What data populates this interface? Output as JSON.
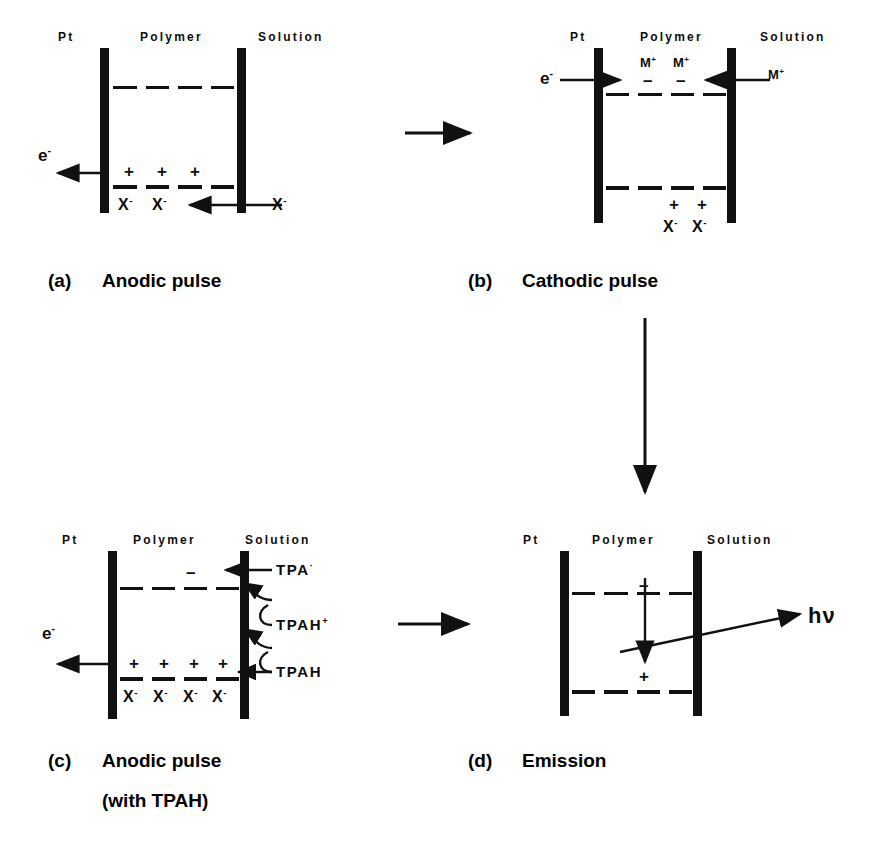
{
  "figure": {
    "type": "mechanism-diagram",
    "region_labels": {
      "electrode": "Pt",
      "film": "Polymer",
      "bulk": "Solution"
    }
  },
  "panels": [
    {
      "id": "a",
      "caption_tag": "(a)",
      "caption": "Anodic pulse",
      "headers": {
        "left": "Pt",
        "middle": "Polymer",
        "right": "Solution"
      },
      "electron_label": "e",
      "electron_charge": "-",
      "polarity": "anodic",
      "holes": [
        "+",
        "+",
        "+"
      ],
      "counter_ion_labels": [
        "X",
        "X"
      ],
      "counter_ion_charge": "-",
      "incoming_ion_label": "X",
      "incoming_ion_charge": "-",
      "levels": [
        "LUMO",
        "HOMO"
      ]
    },
    {
      "id": "b",
      "caption_tag": "(b)",
      "caption": "Cathodic pulse",
      "headers": {
        "left": "Pt",
        "middle": "Polymer",
        "right": "Solution"
      },
      "electron_label": "e",
      "electron_charge": "-",
      "polarity": "cathodic",
      "injected_electrons": [
        "–",
        "–"
      ],
      "cation_labels": [
        "M",
        "M"
      ],
      "cation_charge": "+",
      "incoming_ion_label": "M",
      "incoming_ion_charge": "+",
      "residual_holes": [
        "+",
        "+"
      ],
      "residual_ion_labels": [
        "X",
        "X"
      ],
      "residual_ion_charge": "-"
    },
    {
      "id": "c",
      "caption_tag": "(c)",
      "caption": "Anodic pulse",
      "caption_line2": "(with TPAH)",
      "headers": {
        "left": "Pt",
        "middle": "Polymer",
        "right": "Solution"
      },
      "electron_label": "e",
      "electron_charge": "-",
      "species": [
        {
          "name": "TPA",
          "charge": "·"
        },
        {
          "name": "TPAH",
          "charge": "+"
        },
        {
          "name": "TPAH",
          "charge": ""
        }
      ],
      "holes": [
        "+",
        "+",
        "+",
        "+"
      ],
      "counter_ion_labels": [
        "X",
        "X",
        "X",
        "X"
      ],
      "counter_ion_charge": "-"
    },
    {
      "id": "d",
      "caption_tag": "(d)",
      "caption": "Emission",
      "headers": {
        "left": "Pt",
        "middle": "Polymer",
        "right": "Solution"
      },
      "emission_label": "hν",
      "electron_marker": "–",
      "hole_marker": "+",
      "process": "electron-hole recombination"
    }
  ],
  "flow_arrows": [
    {
      "from": "a",
      "to": "b",
      "direction": "right"
    },
    {
      "from": "b",
      "to": "d",
      "direction": "down"
    },
    {
      "from": "c",
      "to": "d",
      "direction": "right"
    }
  ],
  "colors": {
    "ink": "#111111",
    "background": "#ffffff",
    "caption": "#000000"
  }
}
